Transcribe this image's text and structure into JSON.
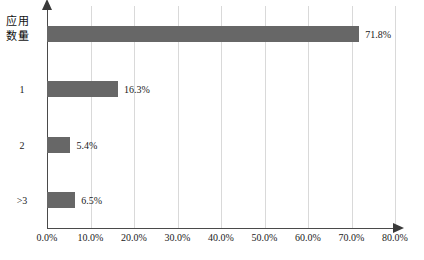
{
  "chart_data": {
    "type": "bar",
    "orientation": "horizontal",
    "title": "",
    "xlabel": "",
    "ylabel": "应用\n数量",
    "ylabel_lines": [
      "应用",
      "数量"
    ],
    "categories": [
      "0",
      "1",
      "2",
      ">3"
    ],
    "values": [
      71.8,
      16.3,
      5.4,
      6.5
    ],
    "value_labels": [
      "71.8%",
      "16.3%",
      "5.4%",
      "6.5%"
    ],
    "xlim": [
      0,
      80
    ],
    "xticks": [
      0,
      10,
      20,
      30,
      40,
      50,
      60,
      70,
      80
    ],
    "xtick_labels": [
      "0.0%",
      "10.0%",
      "20.0%",
      "30.0%",
      "40.0%",
      "50.0%",
      "60.0%",
      "70.0%",
      "80.0%"
    ],
    "grid": "vertical",
    "legend": "none",
    "series": [
      {
        "name": "",
        "values": [
          71.8,
          16.3,
          5.4,
          6.5
        ]
      }
    ],
    "colors": {
      "bar": "#676767",
      "gridline": "#d9d9d9",
      "axis": "#4a4a4a",
      "text": "#1a1a1a",
      "background": "#ffffff"
    }
  }
}
